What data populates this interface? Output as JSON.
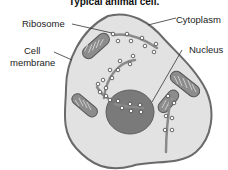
{
  "title": "Typical animal cell.",
  "labels": {
    "ribosome": "Ribosome",
    "cytoplasm": "Cytoplasm",
    "cell_membrane_line1": "Cell",
    "cell_membrane_line2": "membrane",
    "nucleus": "Nucleus"
  },
  "colors": {
    "cytoplasm_fill": "#e2e2e2",
    "membrane_stroke": "#6a6a6a",
    "nucleus_fill": "#7a7a7a",
    "er_stroke": "#8a8a8a",
    "ribosome_fill": "#ffffff",
    "mitochondria_fill": "#8c8c8c"
  }
}
